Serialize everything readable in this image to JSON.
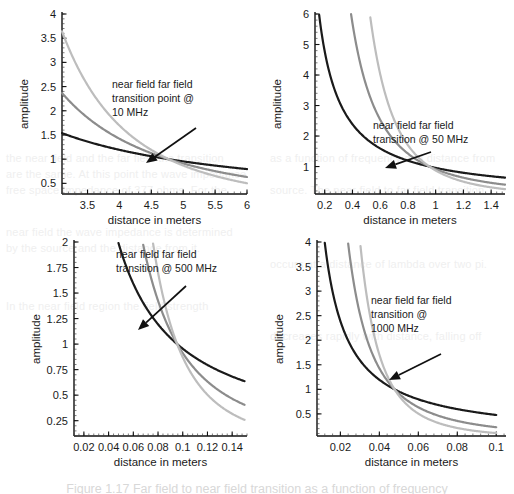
{
  "figure": {
    "caption": "Figure 1.17  Far field to near field transition as a function of frequency",
    "panel_count": 4
  },
  "ghost_text": [
    "the near field and the far field the transition",
    "are the same. At this point the wave impedance",
    "free space impedance of 377 ohms. For the",
    "near field the wave impedance is determined",
    "by the source and the distance from it.",
    "as a function of frequency and distance from",
    "source. The near field to far field transition",
    "occurs at a distance of lambda over two pi.",
    "In the near field region the field strength",
    "decreases rapidly with distance, falling off"
  ],
  "chart_data": [
    {
      "id": "panel-10mhz",
      "type": "line",
      "title": "",
      "xlabel": "distance in meters",
      "ylabel": "amplitude",
      "xlim": [
        3.1,
        6.0
      ],
      "ylim": [
        0.28,
        4.0
      ],
      "xticks": [
        "3.5",
        "4",
        "4.5",
        "5",
        "5.5",
        "6"
      ],
      "xtick_values": [
        3.5,
        4,
        4.5,
        5,
        5.5,
        6
      ],
      "yticks": [
        "0.5",
        "1",
        "1.5",
        "2",
        "2.5",
        "3",
        "3.5",
        "4"
      ],
      "ytick_values": [
        0.5,
        1,
        1.5,
        2,
        2.5,
        3,
        3.5,
        4
      ],
      "grid": false,
      "transition_x": 4.77,
      "transition_y": 1.0,
      "annotation": "near field far field transition point @ 10 MHz",
      "annotation_lines": [
        "near field far field",
        "transition point @",
        "10 MHz"
      ],
      "series": [
        {
          "name": "1/r",
          "color": "#1a1a1a",
          "exponent": 1,
          "x": [
            3.1,
            3.3,
            3.5,
            3.7,
            3.9,
            4.1,
            4.3,
            4.5,
            4.77,
            5.0,
            5.2,
            5.4,
            5.6,
            5.8,
            6.0
          ],
          "values": [
            1.47,
            1.41,
            1.36,
            1.3,
            1.25,
            1.21,
            1.16,
            1.12,
            1.0,
            0.96,
            0.93,
            0.9,
            0.87,
            0.84,
            0.81
          ]
        },
        {
          "name": "1/r^2",
          "color": "#8c8c8c",
          "exponent": 2,
          "x": [
            3.1,
            3.3,
            3.5,
            3.7,
            3.9,
            4.1,
            4.3,
            4.5,
            4.77,
            5.0,
            5.2,
            5.4,
            5.6,
            5.8,
            6.0
          ],
          "values": [
            2.37,
            2.09,
            1.86,
            1.67,
            1.5,
            1.36,
            1.23,
            1.13,
            1.0,
            0.91,
            0.84,
            0.78,
            0.73,
            0.68,
            0.63
          ]
        },
        {
          "name": "1/r^3",
          "color": "#bdbdbd",
          "exponent": 3,
          "x": [
            3.1,
            3.3,
            3.5,
            3.7,
            3.9,
            4.1,
            4.3,
            4.5,
            4.77,
            5.0,
            5.2,
            5.4,
            5.6,
            5.8,
            6.0
          ],
          "values": [
            3.9,
            3.24,
            2.72,
            2.3,
            1.96,
            1.68,
            1.45,
            1.27,
            1.0,
            0.87,
            0.77,
            0.69,
            0.62,
            0.56,
            0.5
          ]
        }
      ]
    },
    {
      "id": "panel-50mhz",
      "type": "line",
      "title": "",
      "xlabel": "distance in meters",
      "ylabel": "amplitude",
      "xlim": [
        0.13,
        1.5
      ],
      "ylim": [
        0.1,
        6.0
      ],
      "xticks": [
        "0.2",
        "0.4",
        "0.6",
        "0.8",
        "1",
        "1.2",
        "1.4"
      ],
      "xtick_values": [
        0.2,
        0.4,
        0.6,
        0.8,
        1.0,
        1.2,
        1.4
      ],
      "yticks": [
        "1",
        "2",
        "3",
        "4",
        "5",
        "6"
      ],
      "ytick_values": [
        1,
        2,
        3,
        4,
        5,
        6
      ],
      "grid": false,
      "transition_x": 0.955,
      "transition_y": 1.0,
      "annotation": "near field far field transition @ 50 MHz",
      "annotation_lines": [
        "near field far field",
        "transition @ 50 MHz"
      ],
      "series": [
        {
          "name": "1/r",
          "color": "#1a1a1a",
          "exponent": 1,
          "x": [
            0.16,
            0.2,
            0.25,
            0.3,
            0.4,
            0.5,
            0.6,
            0.7,
            0.8,
            0.955,
            1.1,
            1.2,
            1.3,
            1.4,
            1.5
          ],
          "values": [
            5.97,
            4.78,
            3.82,
            3.18,
            2.39,
            1.91,
            1.59,
            1.36,
            1.19,
            1.0,
            0.87,
            0.8,
            0.73,
            0.68,
            0.64
          ]
        },
        {
          "name": "1/r^2",
          "color": "#8c8c8c",
          "exponent": 2,
          "x": [
            0.39,
            0.45,
            0.5,
            0.6,
            0.7,
            0.8,
            0.9,
            0.955,
            1.1,
            1.2,
            1.3,
            1.4,
            1.5
          ],
          "values": [
            6.0,
            4.5,
            3.65,
            2.53,
            1.86,
            1.42,
            1.13,
            1.0,
            0.75,
            0.63,
            0.54,
            0.47,
            0.41
          ]
        },
        {
          "name": "1/r^3",
          "color": "#bdbdbd",
          "exponent": 3,
          "x": [
            0.52,
            0.58,
            0.65,
            0.72,
            0.8,
            0.88,
            0.955,
            1.05,
            1.15,
            1.25,
            1.35,
            1.5
          ],
          "values": [
            6.0,
            4.47,
            3.17,
            2.33,
            1.7,
            1.28,
            1.0,
            0.75,
            0.57,
            0.45,
            0.35,
            0.26
          ]
        }
      ]
    },
    {
      "id": "panel-500mhz",
      "type": "line",
      "title": "",
      "xlabel": "distance in meters",
      "ylabel": "amplitude",
      "xlim": [
        0.012,
        0.152
      ],
      "ylim": [
        0.1,
        2.0
      ],
      "xticks": [
        "0.02",
        "0.04",
        "0.06",
        "0.08",
        "0.1",
        "0.12",
        "0.14"
      ],
      "xtick_values": [
        0.02,
        0.04,
        0.06,
        0.08,
        0.1,
        0.12,
        0.14
      ],
      "yticks": [
        "0.25",
        "0.5",
        "0.75",
        "1",
        "1.25",
        "1.5",
        "1.75",
        "2"
      ],
      "ytick_values": [
        0.25,
        0.5,
        0.75,
        1,
        1.25,
        1.5,
        1.75,
        2
      ],
      "grid": false,
      "transition_x": 0.0955,
      "transition_y": 1.0,
      "annotation": "near field far field transition @ 500 MHz",
      "annotation_lines": [
        "near field far field",
        "transition @ 500 MHz"
      ],
      "series": [
        {
          "name": "1/r",
          "color": "#1a1a1a",
          "exponent": 1,
          "x": [
            0.048,
            0.055,
            0.062,
            0.07,
            0.08,
            0.0955,
            0.11,
            0.12,
            0.13,
            0.14,
            0.15
          ],
          "values": [
            1.99,
            1.74,
            1.54,
            1.36,
            1.19,
            1.0,
            0.87,
            0.8,
            0.73,
            0.68,
            0.64
          ]
        },
        {
          "name": "1/r^2",
          "color": "#8c8c8c",
          "exponent": 2,
          "x": [
            0.068,
            0.074,
            0.08,
            0.086,
            0.0955,
            0.105,
            0.115,
            0.125,
            0.135,
            0.15
          ],
          "values": [
            1.97,
            1.66,
            1.42,
            1.23,
            1.0,
            0.83,
            0.69,
            0.58,
            0.5,
            0.41
          ]
        },
        {
          "name": "1/r^3",
          "color": "#bdbdbd",
          "exponent": 3,
          "x": [
            0.076,
            0.082,
            0.088,
            0.0955,
            0.105,
            0.115,
            0.125,
            0.135,
            0.15
          ],
          "values": [
            1.98,
            1.58,
            1.28,
            1.0,
            0.75,
            0.57,
            0.45,
            0.35,
            0.26
          ]
        }
      ]
    },
    {
      "id": "panel-1000mhz",
      "type": "line",
      "title": "",
      "xlabel": "distance in meters",
      "ylabel": "amplitude",
      "xlim": [
        0.008,
        0.105
      ],
      "ylim": [
        0.05,
        4.0
      ],
      "xticks": [
        "0.02",
        "0.04",
        "0.06",
        "0.08",
        "0.1"
      ],
      "xtick_values": [
        0.02,
        0.04,
        0.06,
        0.08,
        0.1
      ],
      "yticks": [
        "0.5",
        "1",
        "1.5",
        "2",
        "2.5",
        "3",
        "3.5",
        "4"
      ],
      "ytick_values": [
        0.5,
        1,
        1.5,
        2,
        2.5,
        3,
        3.5,
        4
      ],
      "grid": false,
      "transition_x": 0.0478,
      "transition_y": 1.0,
      "annotation": "near field far field transition @ 1000 MHz",
      "annotation_lines": [
        "near field far field",
        "transition @",
        "1000 MHz"
      ],
      "series": [
        {
          "name": "1/r",
          "color": "#1a1a1a",
          "exponent": 1,
          "x": [
            0.012,
            0.015,
            0.02,
            0.025,
            0.03,
            0.035,
            0.04,
            0.0478,
            0.06,
            0.07,
            0.08,
            0.09,
            0.1
          ],
          "values": [
            3.98,
            3.19,
            2.39,
            1.91,
            1.59,
            1.37,
            1.2,
            1.0,
            0.8,
            0.68,
            0.6,
            0.53,
            0.48
          ]
        },
        {
          "name": "1/r^2",
          "color": "#8c8c8c",
          "exponent": 2,
          "x": [
            0.024,
            0.027,
            0.03,
            0.035,
            0.04,
            0.0478,
            0.055,
            0.065,
            0.075,
            0.085,
            0.1
          ],
          "values": [
            3.96,
            3.13,
            2.54,
            1.86,
            1.43,
            1.0,
            0.76,
            0.54,
            0.41,
            0.32,
            0.23
          ]
        },
        {
          "name": "1/r^3",
          "color": "#bdbdbd",
          "exponent": 3,
          "x": [
            0.03,
            0.033,
            0.036,
            0.04,
            0.044,
            0.0478,
            0.055,
            0.065,
            0.075,
            0.085,
            0.1
          ],
          "values": [
            4.04,
            3.04,
            2.34,
            1.71,
            1.28,
            1.0,
            0.66,
            0.4,
            0.26,
            0.18,
            0.11
          ]
        }
      ]
    }
  ]
}
